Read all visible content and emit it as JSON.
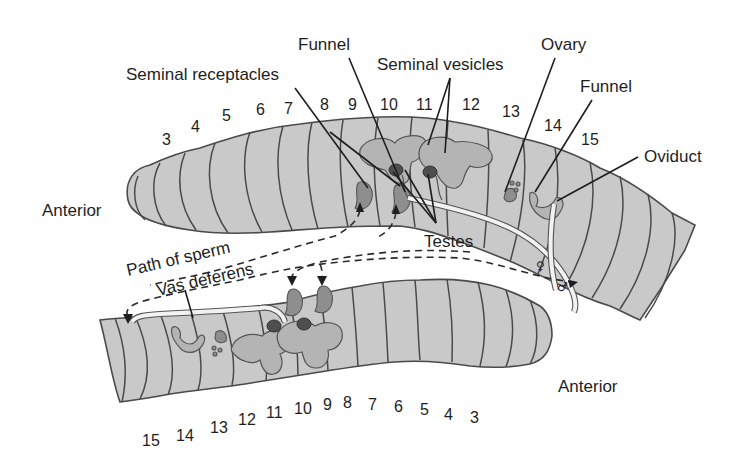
{
  "diagram": {
    "colors": {
      "background": "#ffffff",
      "body_fill": "#c9c9c9",
      "body_outline": "#4a4a4a",
      "organ_fill": "#b4b4b4",
      "receptacle_fill": "#8e8e8e",
      "testis_fill": "#4e4e4e",
      "text": "#1e1e1e"
    },
    "upper_worm": {
      "end_label": "Anterior",
      "segment_numbers": [
        "3",
        "4",
        "5",
        "6",
        "7",
        "8",
        "9",
        "10",
        "11",
        "12",
        "13",
        "14",
        "15"
      ]
    },
    "lower_worm": {
      "end_label": "Anterior",
      "segment_numbers": [
        "15",
        "14",
        "13",
        "12",
        "11",
        "10",
        "9",
        "8",
        "7",
        "6",
        "5",
        "4",
        "3"
      ]
    },
    "labels": {
      "funnel_male": "Funnel",
      "seminal_receptacles": "Seminal receptacles",
      "seminal_vesicles": "Seminal vesicles",
      "ovary": "Ovary",
      "funnel_female": "Funnel",
      "oviduct": "Oviduct",
      "testes": "Testes",
      "path_of_sperm": "Path of sperm",
      "vas_deferens": "Vas deferens",
      "female_symbol": "♀",
      "male_symbol": "♂"
    }
  }
}
